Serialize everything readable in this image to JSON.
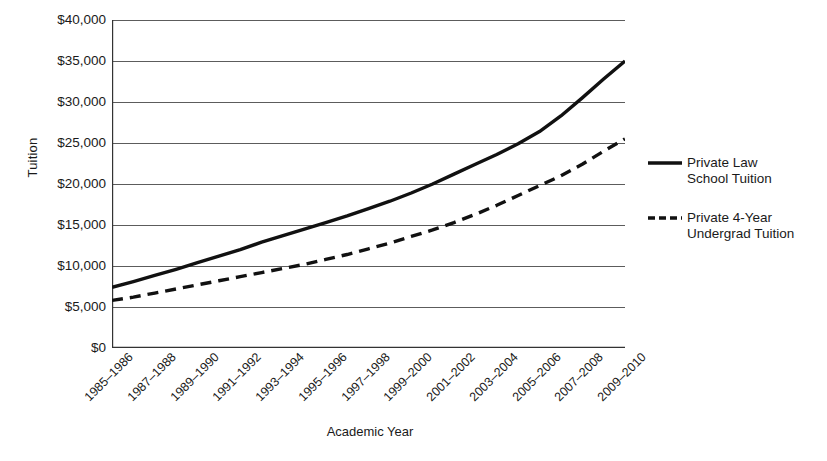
{
  "chart_data": {
    "type": "line",
    "title": "",
    "xlabel": "Academic Year",
    "ylabel": "Tuition",
    "grid": true,
    "legend_position": "right",
    "ylim": [
      0,
      40000
    ],
    "ytick_labels": [
      "$40,000",
      "$35,000",
      "$30,000",
      "$25,000",
      "$20,000",
      "$15,000",
      "$10,000",
      "$5,000",
      "$0"
    ],
    "ytick_values": [
      40000,
      35000,
      30000,
      25000,
      20000,
      15000,
      10000,
      5000,
      0
    ],
    "x": [
      "1985–1986",
      "1986–1987",
      "1987–1988",
      "1988–1989",
      "1989–1990",
      "1990–1991",
      "1991–1992",
      "1992–1993",
      "1993–1994",
      "1994–1995",
      "1995–1996",
      "1996–1997",
      "1997–1998",
      "1998–1999",
      "1999–2000",
      "2000–2001",
      "2001–2002",
      "2002–2003",
      "2003–2004",
      "2004–2005",
      "2005–2006",
      "2006–2007",
      "2007–2008",
      "2008–2009",
      "2009–2010"
    ],
    "xtick_labels": [
      "1985–1986",
      "1987–1988",
      "1989–1990",
      "1991–1992",
      "1993–1994",
      "1995–1996",
      "1997–1998",
      "1999–2000",
      "2001–2002",
      "2003–2004",
      "2005–2006",
      "2007–2008",
      "2009–2010"
    ],
    "series": [
      {
        "name": "Private Law School Tuition",
        "legend_label": "Private Law\nSchool Tuition",
        "style": "solid",
        "color": "#111111",
        "values": [
          7400,
          8100,
          8850,
          9600,
          10400,
          11200,
          12000,
          12900,
          13700,
          14500,
          15300,
          16100,
          17000,
          17900,
          18900,
          20000,
          21200,
          22400,
          23600,
          24900,
          26400,
          28300,
          30500,
          32800,
          35000
        ]
      },
      {
        "name": "Private 4-Year Undergrad Tuition",
        "legend_label": "Private 4-Year\nUndergrad Tuition",
        "style": "dashed",
        "color": "#111111",
        "values": [
          5800,
          6200,
          6700,
          7200,
          7700,
          8200,
          8700,
          9200,
          9700,
          10200,
          10800,
          11400,
          12100,
          12800,
          13600,
          14400,
          15300,
          16300,
          17400,
          18600,
          19800,
          21000,
          22400,
          24000,
          25500
        ]
      }
    ]
  }
}
